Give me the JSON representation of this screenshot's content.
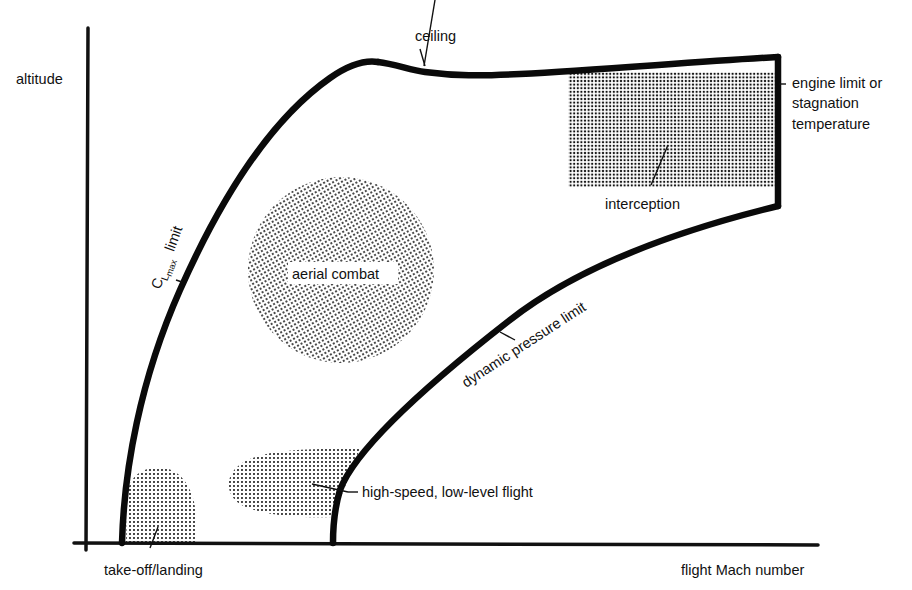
{
  "figure": {
    "type": "flight envelope diagram",
    "axes": {
      "y_label": "altitude",
      "x_label": "flight Mach number"
    },
    "boundaries": [
      {
        "id": "clmax",
        "label_prefix": "C",
        "label_sub1": "L",
        "label_sub2": "max",
        "label_suffix": "limit",
        "full_label": "C_Lmax limit"
      },
      {
        "id": "ceiling",
        "label": "ceiling"
      },
      {
        "id": "engine",
        "label_lines": [
          "engine limit or",
          "stagnation",
          "temperature"
        ]
      },
      {
        "id": "dynamic",
        "label": "dynamic pressure limit"
      }
    ],
    "regions": [
      {
        "id": "aerial-combat",
        "label": "aerial combat"
      },
      {
        "id": "interception",
        "label": "interception"
      },
      {
        "id": "take-off-landing",
        "label": "take-off/landing"
      },
      {
        "id": "high-speed-low-level",
        "label": "high-speed, low-level flight"
      }
    ],
    "colors": {
      "line": "#0a0a0a",
      "stipple": "#1a1a1a",
      "background": "#ffffff"
    }
  }
}
